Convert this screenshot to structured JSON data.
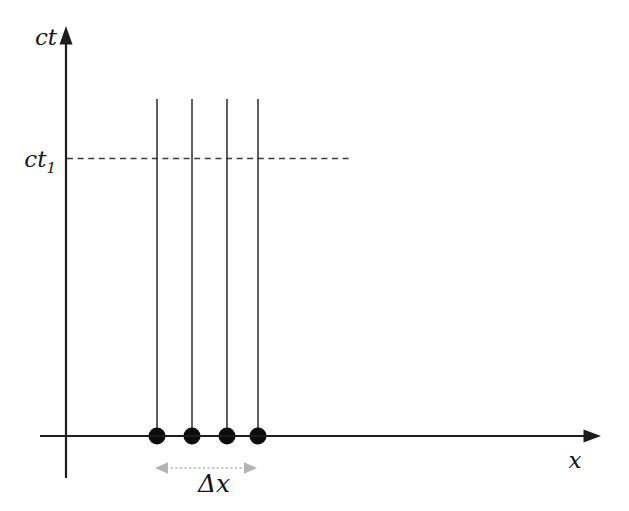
{
  "figure": {
    "type": "spacetime-diagram",
    "background_color": "#ffffff",
    "ink_color": "#1d1d1d",
    "accent_gray": "#b4b4b4",
    "y_axis_label": "ct",
    "x_axis_label": "x",
    "time_slice_label_base": "ct",
    "time_slice_label_sub": "1",
    "interval_label": "Δx",
    "worldlines": {
      "count": 4,
      "x_positions": [
        157,
        192,
        227,
        258
      ],
      "top_y": 99,
      "bottom_y": 436,
      "dot_radius": 8.5
    },
    "dashed_time_slice": {
      "y": 158.5,
      "x_start": 67,
      "x_end": 350
    },
    "interval_arrow": {
      "y": 468,
      "x_start": 155,
      "x_end": 257
    }
  }
}
